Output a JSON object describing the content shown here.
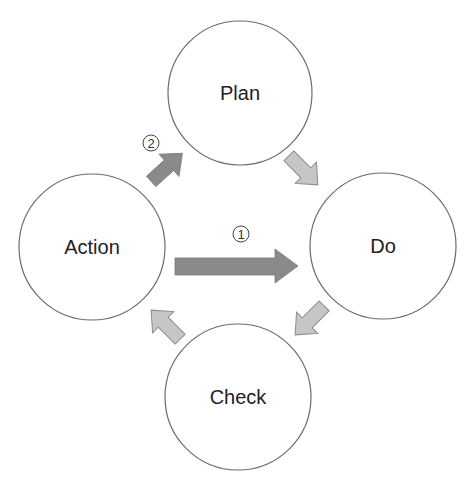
{
  "diagram": {
    "type": "PDCA cycle",
    "nodes": [
      {
        "id": "plan",
        "label": "Plan"
      },
      {
        "id": "do",
        "label": "Do"
      },
      {
        "id": "check",
        "label": "Check"
      },
      {
        "id": "action",
        "label": "Action"
      }
    ],
    "edges": [
      {
        "from": "plan",
        "to": "do",
        "style": "light"
      },
      {
        "from": "do",
        "to": "check",
        "style": "light"
      },
      {
        "from": "check",
        "to": "action",
        "style": "light"
      },
      {
        "from": "action",
        "to": "plan",
        "style": "dark",
        "step": "②"
      },
      {
        "from": "action",
        "to": "do",
        "style": "dark-large",
        "step": "①"
      }
    ],
    "step_labels": {
      "one": "①",
      "two": "②"
    },
    "colors": {
      "circle_stroke": "#6b6b6b",
      "dark_arrow": "#8a8a8a",
      "light_arrow": "#c6c6c6",
      "light_arrow_stroke": "#8c8c8c",
      "text": "#222222"
    }
  }
}
